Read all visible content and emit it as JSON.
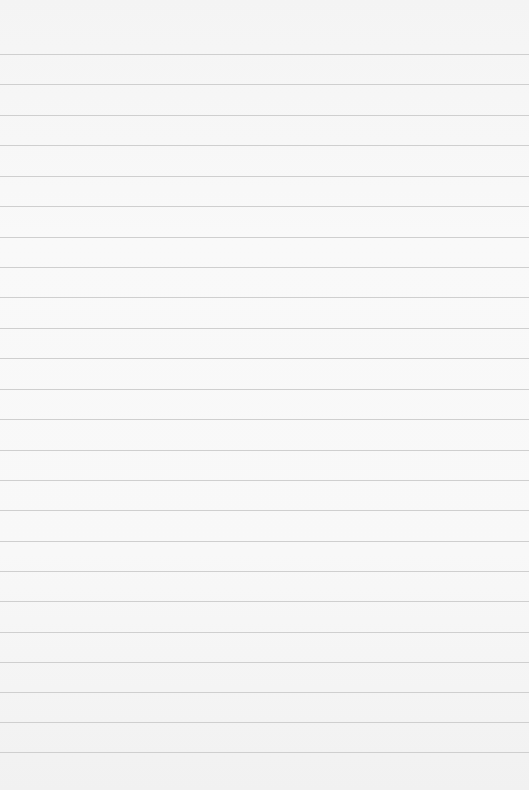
{
  "paper": {
    "background": "#f7f7f7",
    "line_color": "#cfcfcf",
    "line_positions": [
      54,
      84,
      115,
      145,
      176,
      206,
      237,
      267,
      297,
      328,
      358,
      389,
      419,
      450,
      480,
      510,
      541,
      571,
      601,
      632,
      662,
      692,
      722,
      752
    ]
  }
}
